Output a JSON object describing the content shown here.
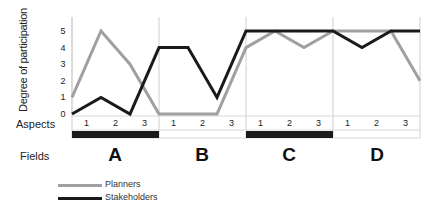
{
  "chart_data": {
    "type": "line",
    "title": "",
    "ylabel": "Degree of participation",
    "xlabel": "Aspects",
    "ylim": [
      0,
      5
    ],
    "yticks": [
      0,
      1,
      2,
      3,
      4,
      5
    ],
    "x_points": 13,
    "aspect_labels": [
      "1",
      "2",
      "3",
      "1",
      "2",
      "3",
      "1",
      "2",
      "3",
      "1",
      "2",
      "3"
    ],
    "fields_label": "Fields",
    "fields": [
      "A",
      "B",
      "C",
      "D"
    ],
    "field_bar_filled": [
      true,
      false,
      true,
      false
    ],
    "series": [
      {
        "name": "Planners",
        "color": "#a0a0a0",
        "values": [
          1,
          5,
          3,
          0,
          0,
          0,
          4,
          5,
          4,
          5,
          5,
          5,
          2
        ]
      },
      {
        "name": "Stakeholders",
        "color": "#1a1a1a",
        "values": [
          0,
          1,
          0,
          4,
          4,
          1,
          5,
          5,
          5,
          5,
          4,
          5,
          5
        ]
      }
    ],
    "legend_position": "bottom-left",
    "grid": false
  },
  "labels": {
    "ylabel": "Degree of participation",
    "aspects": "Aspects",
    "fields": "Fields",
    "legend_planners": "Planners",
    "legend_stakeholders": "Stakeholders",
    "field_a": "A",
    "field_b": "B",
    "field_c": "C",
    "field_d": "D"
  }
}
